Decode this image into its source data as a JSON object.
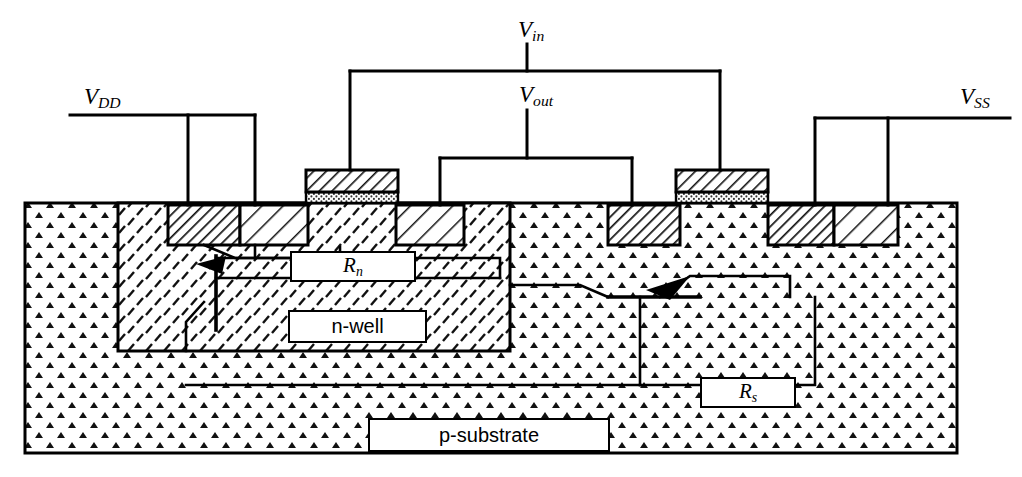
{
  "figure": {
    "kind": "cmos-latchup-cross-section",
    "width": 1022,
    "height": 477,
    "background": "#ffffff",
    "line_color": "#000000"
  },
  "terminals": [
    {
      "id": "vdd",
      "base": "V",
      "sub": "DD",
      "x": 84,
      "y": 84,
      "rail_y": 115,
      "rail_x1": 70,
      "rail_x2": 255,
      "drops": [
        188,
        255
      ]
    },
    {
      "id": "vin",
      "base": "V",
      "sub": "in",
      "x": 518,
      "y": 20,
      "rail_y": 71,
      "rail_x1": 350,
      "rail_x2": 720,
      "drops": [
        350,
        720
      ]
    },
    {
      "id": "vout",
      "base": "V",
      "sub": "out",
      "x": 521,
      "y": 84,
      "rail_y": 158,
      "rail_x1": 440,
      "rail_x2": 632,
      "drops": [
        440,
        632
      ]
    },
    {
      "id": "vss",
      "base": "V",
      "sub": "SS",
      "x": 962,
      "y": 84,
      "rail_y": 118,
      "rail_x1": 815,
      "rail_x2": 1010,
      "drops": [
        815,
        888
      ]
    }
  ],
  "region_labels": [
    {
      "id": "rn",
      "text": "R",
      "sub": "n",
      "style": "ital",
      "x": 290,
      "y": 251,
      "w": 122,
      "h": 27
    },
    {
      "id": "nwell",
      "text": "n-well",
      "sub": "",
      "style": "plain",
      "x": 288,
      "y": 310,
      "w": 135,
      "h": 29
    },
    {
      "id": "rs",
      "text": "R",
      "sub": "s",
      "style": "ital",
      "x": 700,
      "y": 377,
      "w": 92,
      "h": 27
    },
    {
      "id": "psubstrate",
      "text": "p-substrate",
      "sub": "",
      "style": "plain",
      "x": 368,
      "y": 418,
      "w": 238,
      "h": 30
    }
  ],
  "substrate": {
    "name": "p-substrate",
    "x": 25,
    "y": 203,
    "w": 932,
    "h": 250,
    "fill_pattern": "p-substrate-stipple"
  },
  "nwell": {
    "name": "n-well",
    "x": 118,
    "y": 203,
    "w": 392,
    "h": 148,
    "fill_pattern": "n-well-dash"
  },
  "diffusions": [
    {
      "id": "diff-p-plus-left",
      "type": "p+",
      "x": 168,
      "y": 205,
      "w": 72,
      "h": 40,
      "pattern": "dense-hatch"
    },
    {
      "id": "diff-n-plus-1",
      "type": "n+",
      "x": 240,
      "y": 205,
      "w": 68,
      "h": 40,
      "pattern": "sparse-hatch"
    },
    {
      "id": "diff-n-plus-2",
      "type": "n+",
      "x": 396,
      "y": 205,
      "w": 68,
      "h": 40,
      "pattern": "sparse-hatch"
    },
    {
      "id": "diff-p-plus-right",
      "type": "p+",
      "x": 608,
      "y": 205,
      "w": 72,
      "h": 40,
      "pattern": "dense-hatch"
    },
    {
      "id": "diff-p-plus-sub",
      "type": "p+",
      "x": 768,
      "y": 205,
      "w": 66,
      "h": 40,
      "pattern": "dense-hatch"
    },
    {
      "id": "diff-n-plus-sub",
      "type": "n+",
      "x": 834,
      "y": 205,
      "w": 64,
      "h": 40,
      "pattern": "sparse-hatch"
    }
  ],
  "gates": [
    {
      "id": "gate-pmos",
      "x": 306,
      "y": 170,
      "w": 92,
      "poly_h": 22,
      "oxide_h": 11,
      "drop_x": 350
    },
    {
      "id": "gate-nmos",
      "x": 676,
      "y": 170,
      "w": 92,
      "poly_h": 22,
      "oxide_h": 11,
      "drop_x": 720
    }
  ],
  "parasitics": [
    {
      "id": "pnp-transistor",
      "label": "vertical PNP",
      "base_x": 216,
      "base_y1": 256,
      "base_y2": 330
    },
    {
      "id": "npn-transistor",
      "label": "lateral NPN",
      "base_x": 640,
      "base_y1": 297,
      "base_y2": 385
    },
    {
      "id": "rn-resistor",
      "label": "n-well resistance Rn"
    },
    {
      "id": "rs-resistor",
      "label": "substrate resistance Rs"
    }
  ],
  "patterns": {
    "p-substrate-stipple": "triangular-caret stipple",
    "n-well-dash": "short diagonal dashes",
    "dense-hatch": "dense 45-degree hatch (p+)",
    "sparse-hatch": "sparse 45-degree hatch (n+)",
    "poly": "medium 45-degree hatch",
    "oxide": "fine dot stipple"
  }
}
